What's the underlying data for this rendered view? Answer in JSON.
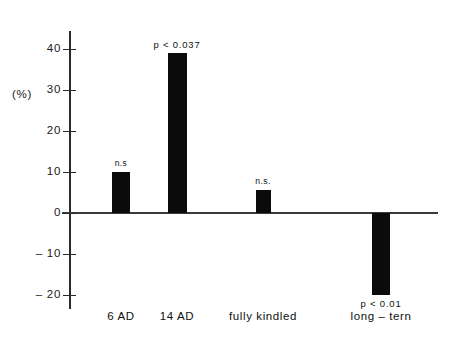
{
  "chart_data": {
    "type": "bar",
    "title": "",
    "subtitle": "",
    "xlabel": "",
    "ylabel": "(%)",
    "ylim": [
      -20,
      40
    ],
    "grid": false,
    "legend": false,
    "legend_position": "none",
    "categories": [
      "6 AD",
      "14 AD",
      "fully kindled",
      "long – tern"
    ],
    "values": [
      10,
      39,
      5.5,
      -20
    ],
    "annotations": [
      "n.s",
      "p < 0.037",
      "n.s.",
      "p < 0.01"
    ],
    "yticks": [
      40,
      30,
      20,
      10,
      0,
      -10,
      -20
    ],
    "ytick_labels": [
      "40",
      "30",
      "20",
      "10",
      "0",
      "– 10",
      "– 20"
    ],
    "bar_color": "#0b0b0b",
    "axis_color": "#2b2b2b"
  },
  "axis": {
    "unit_label": "(%)"
  }
}
